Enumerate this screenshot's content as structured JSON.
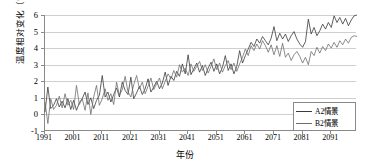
{
  "chart_data": {
    "type": "line",
    "title": "",
    "xlabel": "年份",
    "ylabel": "温度相对变化（℃）",
    "xlim": [
      1991,
      2100
    ],
    "ylim": [
      -1,
      6
    ],
    "grid": true,
    "legend_position": "bottom-right",
    "y_ticks": [
      "6",
      "5",
      "4",
      "3",
      "2",
      "1",
      "0",
      "-1"
    ],
    "y_tick_values": [
      6,
      5,
      4,
      3,
      2,
      1,
      0,
      -1
    ],
    "x_ticks": [
      "1991",
      "2001",
      "2011",
      "2021",
      "2031",
      "2041",
      "2051",
      "2061",
      "2071",
      "2081",
      "2091"
    ],
    "x_tick_values": [
      1991,
      2001,
      2011,
      2021,
      2031,
      2041,
      2051,
      2061,
      2071,
      2081,
      2091
    ],
    "colors": {
      "a2": "#3a3a3a",
      "b2": "#6e6e6e",
      "grid": "#cfcfcf",
      "axis": "#8a8a8a"
    },
    "x": [
      1991,
      1992,
      1993,
      1994,
      1995,
      1996,
      1997,
      1998,
      1999,
      2000,
      2001,
      2002,
      2003,
      2004,
      2005,
      2006,
      2007,
      2008,
      2009,
      2010,
      2011,
      2012,
      2013,
      2014,
      2015,
      2016,
      2017,
      2018,
      2019,
      2020,
      2021,
      2022,
      2023,
      2024,
      2025,
      2026,
      2027,
      2028,
      2029,
      2030,
      2031,
      2032,
      2033,
      2034,
      2035,
      2036,
      2037,
      2038,
      2039,
      2040,
      2041,
      2042,
      2043,
      2044,
      2045,
      2046,
      2047,
      2048,
      2049,
      2050,
      2051,
      2052,
      2053,
      2054,
      2055,
      2056,
      2057,
      2058,
      2059,
      2060,
      2061,
      2062,
      2063,
      2064,
      2065,
      2066,
      2067,
      2068,
      2069,
      2070,
      2071,
      2072,
      2073,
      2074,
      2075,
      2076,
      2077,
      2078,
      2079,
      2080,
      2081,
      2082,
      2083,
      2084,
      2085,
      2086,
      2087,
      2088,
      2089,
      2090,
      2091,
      2092,
      2093,
      2094,
      2095,
      2096,
      2097,
      2098,
      2099,
      2100
    ],
    "series": [
      {
        "name": "A2情景",
        "color": "#3a3a3a",
        "values": [
          0.15,
          1.65,
          0.35,
          0.55,
          0.95,
          0.45,
          0.8,
          0.4,
          0.95,
          0.3,
          0.85,
          0.25,
          0.7,
          0.95,
          1.35,
          0.6,
          1.0,
          0.35,
          0.85,
          1.15,
          2.35,
          1.05,
          1.35,
          0.75,
          1.2,
          1.6,
          1.05,
          1.95,
          1.45,
          1.2,
          2.25,
          0.95,
          1.3,
          1.7,
          1.2,
          1.55,
          2.15,
          1.35,
          1.65,
          2.0,
          1.55,
          1.9,
          2.55,
          1.75,
          2.3,
          2.05,
          2.6,
          2.3,
          3.05,
          2.45,
          3.6,
          2.4,
          2.75,
          3.1,
          2.55,
          2.95,
          2.35,
          2.8,
          3.15,
          2.6,
          3.05,
          2.45,
          2.85,
          3.55,
          2.65,
          3.05,
          2.45,
          2.9,
          3.85,
          3.1,
          3.55,
          3.95,
          4.35,
          4.1,
          4.55,
          4.3,
          4.7,
          4.45,
          4.2,
          4.6,
          5.3,
          4.45,
          4.9,
          4.55,
          4.85,
          4.4,
          4.75,
          5.0,
          4.55,
          4.25,
          4.05,
          4.4,
          5.75,
          4.85,
          5.25,
          4.75,
          5.05,
          5.45,
          5.15,
          5.55,
          5.25,
          5.95,
          5.55,
          5.85,
          5.45,
          5.8,
          5.35,
          5.7,
          5.95,
          6.0
        ]
      },
      {
        "name": "B2情景",
        "color": "#6e6e6e",
        "values": [
          0.75,
          -0.55,
          0.95,
          0.3,
          0.55,
          1.1,
          0.4,
          1.25,
          0.55,
          0.85,
          0.3,
          1.75,
          0.6,
          0.95,
          0.25,
          1.3,
          0.0,
          1.05,
          1.75,
          0.55,
          0.95,
          1.55,
          0.85,
          1.25,
          0.6,
          1.95,
          1.15,
          1.5,
          2.3,
          1.35,
          1.05,
          1.8,
          2.35,
          1.55,
          1.95,
          1.25,
          1.7,
          2.2,
          1.5,
          1.85,
          2.2,
          1.55,
          2.0,
          2.45,
          2.15,
          2.65,
          2.25,
          3.0,
          2.55,
          2.8,
          2.35,
          3.05,
          2.6,
          2.9,
          3.2,
          2.65,
          3.0,
          2.5,
          2.9,
          3.35,
          2.7,
          3.1,
          2.55,
          2.95,
          3.25,
          2.7,
          3.1,
          2.6,
          3.05,
          3.45,
          3.95,
          3.55,
          4.15,
          3.85,
          4.25,
          3.95,
          4.45,
          4.15,
          3.75,
          4.2,
          3.6,
          4.15,
          3.5,
          4.3,
          3.45,
          3.7,
          3.25,
          3.6,
          3.8,
          3.5,
          3.1,
          3.45,
          3.0,
          3.8,
          3.55,
          4.05,
          3.7,
          4.1,
          3.85,
          4.25,
          4.0,
          4.35,
          4.05,
          4.45,
          4.2,
          4.55,
          4.3,
          4.65,
          4.75,
          4.7
        ]
      }
    ]
  },
  "legend": {
    "items": [
      {
        "label": "A2情景"
      },
      {
        "label": "B2情景"
      }
    ]
  }
}
